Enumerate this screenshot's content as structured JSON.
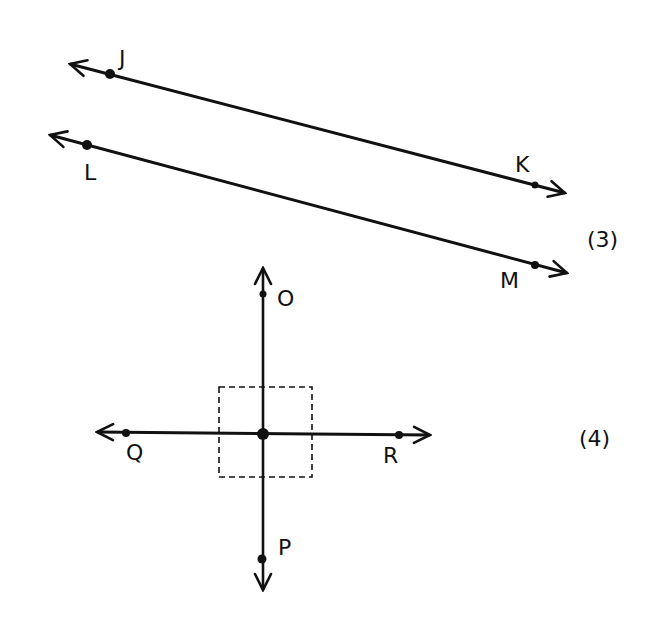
{
  "figures": [
    {
      "number": "(3)",
      "description": "Parallel lines JK and LM",
      "lines": [
        {
          "name": "line-jk",
          "points": [
            {
              "label": "J"
            },
            {
              "label": "K"
            }
          ]
        },
        {
          "name": "line-lm",
          "points": [
            {
              "label": "L"
            },
            {
              "label": "M"
            }
          ]
        }
      ]
    },
    {
      "number": "(4)",
      "description": "Perpendicular lines OP and QR with right-angle box",
      "lines": [
        {
          "name": "line-op",
          "points": [
            {
              "label": "O"
            },
            {
              "label": "P"
            }
          ]
        },
        {
          "name": "line-qr",
          "points": [
            {
              "label": "Q"
            },
            {
              "label": "R"
            }
          ]
        }
      ]
    }
  ],
  "colors": {
    "ink": "#111111",
    "background": "#ffffff"
  }
}
